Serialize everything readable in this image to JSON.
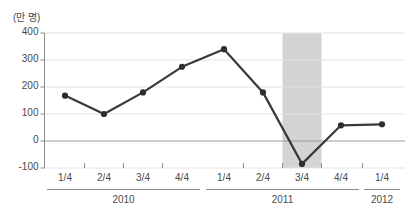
{
  "chart_data": {
    "type": "line",
    "title": "",
    "subtitle": "",
    "unit_label": "(만 명)",
    "xlabel": "",
    "ylabel": "",
    "ylim": [
      -100,
      400
    ],
    "yticks": [
      400,
      300,
      200,
      100,
      0,
      -100
    ],
    "ytick_labels": [
      "400",
      "300",
      "200",
      "100",
      "0",
      "-100"
    ],
    "grid": true,
    "legend": null,
    "categories": [
      "1/4",
      "2/4",
      "3/4",
      "4/4",
      "1/4",
      "2/4",
      "3/4",
      "4/4",
      "1/4"
    ],
    "groups": [
      {
        "label": "2010",
        "start": 0,
        "count": 4
      },
      {
        "label": "2011",
        "start": 4,
        "count": 4
      },
      {
        "label": "2012",
        "start": 8,
        "count": 1
      }
    ],
    "series": [
      {
        "name": "취업자 증감",
        "values": [
          168,
          100,
          180,
          275,
          340,
          180,
          -85,
          58,
          62
        ],
        "color": "#3a3a3a",
        "marker": "circle"
      }
    ],
    "highlight_band": {
      "from_index": 5.5,
      "to_index": 6.5,
      "label": "2011 3/4",
      "color": "#d4d4d4"
    },
    "colors": {
      "line": "#3a3a3a",
      "marker": "#2e2e2e",
      "grid": "#e3e3e3",
      "axis": "#8c8c8c",
      "band": "#d4d4d4",
      "text": "#4a4a4a"
    }
  }
}
